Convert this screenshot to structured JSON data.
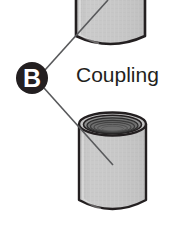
{
  "figure": {
    "name": "coupling-callout-diagram",
    "background_color": "#ffffff"
  },
  "callout": {
    "letter": "B",
    "circle_fill": "#231f20",
    "letter_color": "#ffffff",
    "center_x": 32,
    "center_y": 78,
    "radius": 16
  },
  "labels": {
    "part_name": "Coupling",
    "part_name_color": "#231f20",
    "x": 76,
    "y": 82
  },
  "leader_lines": {
    "color": "#58595b",
    "width": 1.6,
    "upper": {
      "from_x": 45,
      "from_y": 70,
      "to_x": 108,
      "to_y": 0
    },
    "lower": {
      "from_x": 44,
      "from_y": 88,
      "to_x": 113,
      "to_y": 165
    }
  },
  "parts": {
    "pipe_top": {
      "name": "pipe-upper",
      "left": 76,
      "right": 145,
      "top": 0,
      "bottom": 44,
      "fill": "#c9c9c9",
      "stroke": "#231f20"
    },
    "coupling_bottom": {
      "name": "coupling-body",
      "left": 79,
      "right": 146,
      "top": 112,
      "bottom": 212,
      "fill": "#c9c9c9",
      "stroke": "#231f20",
      "bore_fill": "#6e6e6e",
      "thread_count": 4
    }
  }
}
